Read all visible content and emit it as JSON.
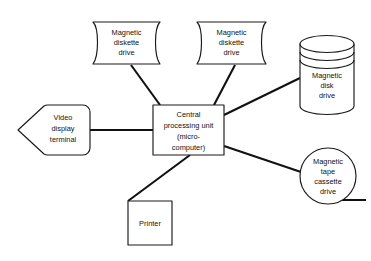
{
  "diagram": {
    "type": "block-diagram",
    "background_color": "#ffffff",
    "line_color": "#111111",
    "text_color": "#111111",
    "nodes": [
      {
        "id": "diskette-drive-1",
        "shape": "punched-card",
        "lines": [
          "Magnetic",
          "diskette",
          "drive"
        ],
        "line1": "Magnetic",
        "line2": "diskette",
        "line3": "drive"
      },
      {
        "id": "diskette-drive-2",
        "shape": "punched-card",
        "lines": [
          "Magnetic",
          "diskette",
          "drive"
        ],
        "line1": "Magnetic",
        "line2": "diskette",
        "line3": "drive"
      },
      {
        "id": "magnetic-disk-drive",
        "shape": "cylinder",
        "lines": [
          "Magnetic",
          "disk",
          "drive"
        ],
        "line1": "Magnetic",
        "line2": "disk",
        "line3": "drive"
      },
      {
        "id": "magnetic-tape-cassette-drive",
        "shape": "circle",
        "lines": [
          "Magnetic",
          "tape",
          "cassette",
          "drive"
        ],
        "line1": "Magnetic",
        "line2": "tape",
        "line3": "cassette",
        "line4": "drive"
      },
      {
        "id": "video-display-terminal",
        "shape": "pentagon-left",
        "lines": [
          "Video",
          "display",
          "terminal"
        ],
        "line1": "Video",
        "line2": "display",
        "line3": "terminal"
      },
      {
        "id": "central-processing-unit",
        "shape": "rectangle",
        "lines": [
          "Central",
          "processing unit",
          "(micro-",
          "computer)"
        ],
        "line1": "Central",
        "line2": "processing unit",
        "line3": "(micro-",
        "line4": "computer)"
      },
      {
        "id": "printer",
        "shape": "rectangle",
        "lines": [
          "Printer"
        ],
        "line1": "Printer"
      }
    ],
    "connections": [
      {
        "from": "diskette-drive-1",
        "to": "central-processing-unit"
      },
      {
        "from": "diskette-drive-2",
        "to": "central-processing-unit"
      },
      {
        "from": "magnetic-disk-drive",
        "to": "central-processing-unit"
      },
      {
        "from": "magnetic-tape-cassette-drive",
        "to": "central-processing-unit"
      },
      {
        "from": "video-display-terminal",
        "to": "central-processing-unit"
      },
      {
        "from": "printer",
        "to": "central-processing-unit"
      }
    ]
  }
}
